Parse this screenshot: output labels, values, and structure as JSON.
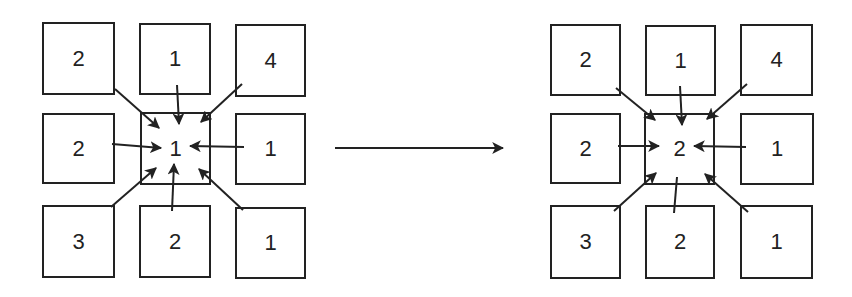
{
  "diagram": {
    "before": {
      "grid": [
        [
          "2",
          "1",
          "4"
        ],
        [
          "2",
          "1",
          "1"
        ],
        [
          "3",
          "2",
          "1"
        ]
      ],
      "center_value": "1"
    },
    "transition_arrow": "right-arrow",
    "after": {
      "grid": [
        [
          "2",
          "1",
          "4"
        ],
        [
          "2",
          "2",
          "1"
        ],
        [
          "3",
          "2",
          "1"
        ]
      ],
      "center_value": "2"
    },
    "colors": {
      "stroke": "#222222",
      "background": "#ffffff"
    }
  }
}
